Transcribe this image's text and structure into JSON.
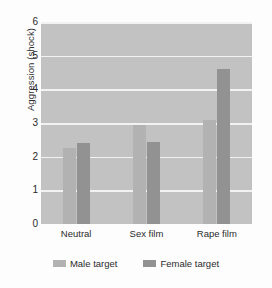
{
  "chart_data": {
    "type": "bar",
    "title": "",
    "xlabel": "",
    "ylabel": "Aggression (shock)",
    "categories": [
      "Neutral",
      "Sex film",
      "Rape film"
    ],
    "series": [
      {
        "name": "Male target",
        "color": "#b2b2b2",
        "values": [
          2.25,
          2.95,
          3.1
        ]
      },
      {
        "name": "Female target",
        "color": "#929292",
        "values": [
          2.4,
          2.45,
          4.6
        ]
      }
    ],
    "ylim": [
      0,
      6
    ],
    "yticks": [
      0,
      1,
      2,
      3,
      4,
      5,
      6
    ],
    "ytick_labels": [
      "0",
      "1",
      "2",
      "3",
      "4",
      "5",
      "6"
    ],
    "grid": true,
    "grid_color": "#f2f2f2",
    "plot_background": "#c2c2c2",
    "legend_position": "bottom"
  },
  "axis": {
    "y_label": "Aggression (shock)"
  },
  "legend": {
    "items": [
      {
        "label": "Male target"
      },
      {
        "label": "Female target"
      }
    ]
  }
}
